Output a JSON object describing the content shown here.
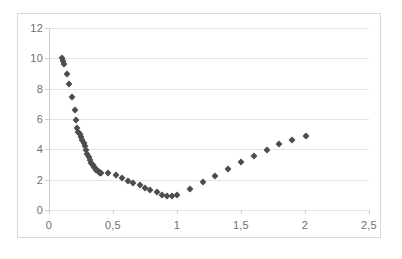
{
  "chart_data": {
    "type": "scatter",
    "title": "",
    "subtitle": "",
    "xlabel": "",
    "ylabel": "",
    "xlim": [
      0,
      2.5
    ],
    "ylim": [
      0,
      12
    ],
    "grid": true,
    "legend": false,
    "legend_position": "none",
    "marker": "diamond",
    "marker_color": "#4d4d4d",
    "decimal_separator": ",",
    "x_ticks": [
      0,
      0.5,
      1,
      1.5,
      2,
      2.5
    ],
    "x_tick_labels": [
      "0",
      "0,5",
      "1",
      "1,5",
      "2",
      "2,5"
    ],
    "y_ticks": [
      0,
      2,
      4,
      6,
      8,
      10,
      12
    ],
    "y_tick_labels": [
      "0",
      "2",
      "4",
      "6",
      "8",
      "10",
      "12"
    ],
    "series": [
      {
        "name": "series-1",
        "points": [
          [
            0.1,
            10.05
          ],
          [
            0.11,
            9.85
          ],
          [
            0.12,
            9.65
          ],
          [
            0.14,
            9.0
          ],
          [
            0.16,
            8.28
          ],
          [
            0.18,
            7.45
          ],
          [
            0.2,
            6.62
          ],
          [
            0.21,
            5.92
          ],
          [
            0.22,
            5.4
          ],
          [
            0.23,
            5.15
          ],
          [
            0.24,
            5.0
          ],
          [
            0.25,
            4.82
          ],
          [
            0.26,
            4.62
          ],
          [
            0.27,
            4.4
          ],
          [
            0.28,
            4.2
          ],
          [
            0.29,
            3.98
          ],
          [
            0.3,
            3.72
          ],
          [
            0.31,
            3.5
          ],
          [
            0.32,
            3.3
          ],
          [
            0.33,
            3.12
          ],
          [
            0.34,
            2.98
          ],
          [
            0.35,
            2.86
          ],
          [
            0.36,
            2.74
          ],
          [
            0.37,
            2.64
          ],
          [
            0.38,
            2.56
          ],
          [
            0.39,
            2.5
          ],
          [
            0.4,
            2.46
          ],
          [
            0.41,
            2.45
          ],
          [
            0.46,
            2.43
          ],
          [
            0.52,
            2.33
          ],
          [
            0.57,
            2.12
          ],
          [
            0.62,
            1.92
          ],
          [
            0.66,
            1.78
          ],
          [
            0.71,
            1.65
          ],
          [
            0.75,
            1.42
          ],
          [
            0.79,
            1.35
          ],
          [
            0.84,
            1.16
          ],
          [
            0.88,
            1.0
          ],
          [
            0.92,
            0.95
          ],
          [
            0.96,
            0.95
          ],
          [
            1.0,
            0.97
          ],
          [
            1.1,
            1.4
          ],
          [
            1.2,
            1.85
          ],
          [
            1.3,
            2.27
          ],
          [
            1.4,
            2.72
          ],
          [
            1.5,
            3.16
          ],
          [
            1.6,
            3.58
          ],
          [
            1.7,
            3.98
          ],
          [
            1.8,
            4.32
          ],
          [
            1.9,
            4.62
          ],
          [
            2.01,
            4.9
          ]
        ]
      }
    ]
  }
}
